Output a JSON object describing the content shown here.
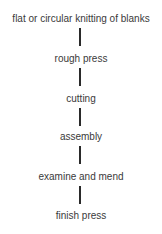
{
  "diagram": {
    "type": "vertical-flowchart",
    "steps": [
      {
        "label": "flat or circular knitting of blanks"
      },
      {
        "label": "rough press"
      },
      {
        "label": "cutting"
      },
      {
        "label": "assembly"
      },
      {
        "label": "examine and mend"
      },
      {
        "label": "finish press"
      }
    ],
    "colors": {
      "text": "#3a3a3a",
      "connector": "#2a2a2a",
      "background": "#ffffff"
    }
  }
}
